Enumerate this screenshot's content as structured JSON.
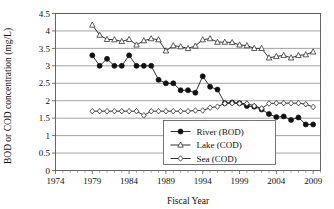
{
  "chart_data": {
    "type": "line",
    "title": "",
    "xlabel": "Fiscal Year",
    "ylabel": "BOD or COD concentration (mg/L)",
    "xlim": [
      1974,
      2010
    ],
    "ylim": [
      0,
      4.5
    ],
    "ytick_labels": [
      "0",
      "0.5",
      "1",
      "1.5",
      "2",
      "2.5",
      "3",
      "3.5",
      "4",
      "4.5"
    ],
    "ytick_values": [
      0,
      0.5,
      1,
      1.5,
      2,
      2.5,
      3,
      3.5,
      4,
      4.5
    ],
    "xtick_labels": [
      "1974",
      "1979",
      "1984",
      "1989",
      "1994",
      "1999",
      "2004",
      "2009"
    ],
    "xtick_values": [
      1974,
      1979,
      1984,
      1989,
      1994,
      1999,
      2004,
      2009
    ],
    "xtick_minor_step": 1,
    "grid": "horizontal",
    "legend_position": "lower-center-right",
    "series": [
      {
        "name": "River (BOD)",
        "marker": "filled-circle",
        "x": [
          1979,
          1980,
          1981,
          1982,
          1983,
          1984,
          1985,
          1986,
          1987,
          1988,
          1989,
          1990,
          1991,
          1992,
          1993,
          1994,
          1995,
          1996,
          1997,
          1998,
          1999,
          2000,
          2001,
          2002,
          2003,
          2004,
          2005,
          2006,
          2007,
          2008,
          2009
        ],
        "values": [
          3.3,
          3.0,
          3.2,
          3.0,
          3.0,
          3.3,
          3.0,
          3.0,
          3.0,
          2.6,
          2.5,
          2.5,
          2.3,
          2.3,
          2.23,
          2.7,
          2.4,
          2.32,
          1.93,
          1.95,
          1.93,
          1.85,
          1.83,
          1.75,
          1.62,
          1.53,
          1.55,
          1.45,
          1.52,
          1.32,
          1.32
        ]
      },
      {
        "name": "Lake (COD)",
        "marker": "open-triangle",
        "x": [
          1979,
          1980,
          1981,
          1982,
          1983,
          1984,
          1985,
          1986,
          1987,
          1988,
          1989,
          1990,
          1991,
          1992,
          1993,
          1994,
          1995,
          1996,
          1997,
          1998,
          1999,
          2000,
          2001,
          2002,
          2003,
          2004,
          2005,
          2006,
          2007,
          2008,
          2009
        ],
        "values": [
          4.17,
          3.88,
          3.76,
          3.75,
          3.7,
          3.76,
          3.6,
          3.72,
          3.78,
          3.75,
          3.43,
          3.58,
          3.55,
          3.5,
          3.57,
          3.75,
          3.78,
          3.68,
          3.68,
          3.67,
          3.6,
          3.58,
          3.5,
          3.5,
          3.23,
          3.27,
          3.3,
          3.23,
          3.3,
          3.32,
          3.4
        ]
      },
      {
        "name": "Sea (COD)",
        "marker": "open-diamond",
        "x": [
          1979,
          1980,
          1981,
          1982,
          1983,
          1984,
          1985,
          1986,
          1987,
          1988,
          1989,
          1990,
          1991,
          1992,
          1993,
          1994,
          1995,
          1996,
          1997,
          1998,
          1999,
          2000,
          2001,
          2002,
          2003,
          2004,
          2005,
          2006,
          2007,
          2008,
          2009
        ],
        "values": [
          1.7,
          1.7,
          1.7,
          1.7,
          1.7,
          1.7,
          1.7,
          1.58,
          1.7,
          1.7,
          1.7,
          1.7,
          1.7,
          1.7,
          1.72,
          1.72,
          1.8,
          1.83,
          1.92,
          1.93,
          1.92,
          1.92,
          1.85,
          1.78,
          1.92,
          1.93,
          1.93,
          1.93,
          1.93,
          1.9,
          1.82
        ]
      }
    ]
  },
  "legend": {
    "items": [
      {
        "label": "River (BOD)",
        "marker": "filled-circle"
      },
      {
        "label": "Lake (COD)",
        "marker": "open-triangle"
      },
      {
        "label": "Sea (COD)",
        "marker": "open-diamond"
      }
    ]
  }
}
